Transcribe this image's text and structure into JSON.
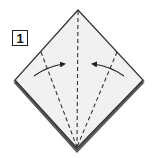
{
  "step": {
    "number": "1"
  },
  "diagram": {
    "paper_fill": "#f1f1f1",
    "edge_color": "#333333",
    "shadow_color": "#555555",
    "crease_style": "valley fold (dashed)",
    "arrows": [
      {
        "name": "left-flap-fold-arrow",
        "direction": "toward center"
      },
      {
        "name": "right-flap-fold-arrow",
        "direction": "toward center"
      }
    ]
  }
}
